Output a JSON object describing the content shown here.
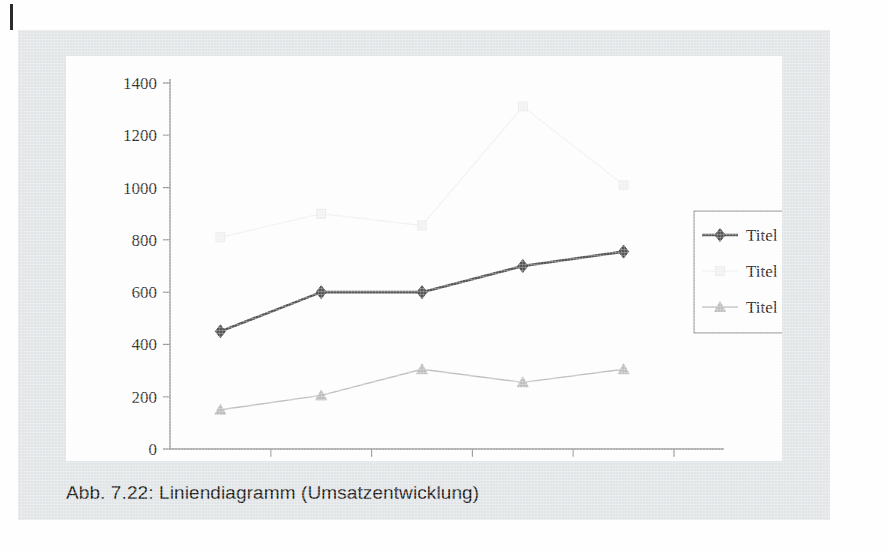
{
  "page": {
    "caption": "Abb. 7.22: Liniendiagramm (Umsatzentwicklung)",
    "margin_tick": "page-margin-rule"
  },
  "colors": {
    "panel_background": "#e2e5e7",
    "chart_background": "#fdfdfd",
    "series1": "#575757",
    "series2": "#f2f2f2",
    "series3": "#bdbdbd",
    "axis": "#9a9a9a",
    "text": "#2e2e2e"
  },
  "chart_data": {
    "type": "line",
    "title": "",
    "xlabel": "",
    "ylabel": "",
    "categories": [
      "2005",
      "2006",
      "2007",
      "2008",
      "2009"
    ],
    "series": [
      {
        "name": "Titel 1",
        "marker": "diamond",
        "color": "#575757",
        "values": [
          450,
          600,
          600,
          700,
          755
        ]
      },
      {
        "name": "Titel 2",
        "marker": "square",
        "color": "#f2f2f2",
        "values": [
          810,
          900,
          855,
          1310,
          1010
        ]
      },
      {
        "name": "Titel 3",
        "marker": "triangle",
        "color": "#bdbdbd",
        "values": [
          150,
          205,
          305,
          255,
          305
        ]
      }
    ],
    "ylim": [
      0,
      1400
    ],
    "yticks": [
      0,
      200,
      400,
      600,
      800,
      1000,
      1200,
      1400
    ],
    "ytick_labels": [
      "0",
      "200",
      "400",
      "600",
      "800",
      "1000",
      "1200",
      "1400"
    ],
    "grid": false,
    "legend_position": "right"
  },
  "legend": {
    "items": [
      {
        "label": "Titel 1",
        "marker": "diamond-marker-icon"
      },
      {
        "label": "Titel 2",
        "marker": "square-marker-icon"
      },
      {
        "label": "Titel 3",
        "marker": "triangle-marker-icon"
      }
    ]
  }
}
